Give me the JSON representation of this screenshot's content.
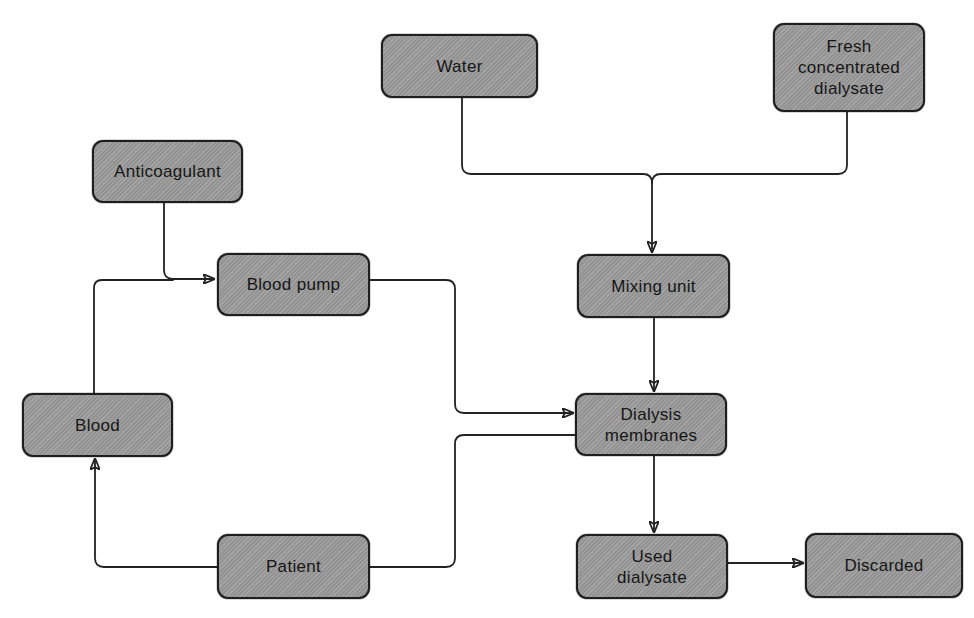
{
  "diagram": {
    "title": "",
    "type": "flowchart",
    "colors": {
      "node_fill": "#9c9c9c",
      "node_border": "#1e1e1e",
      "text": "#161616",
      "connector": "#222222",
      "background": "#ffffff"
    },
    "nodes": {
      "water": {
        "label": "Water"
      },
      "fresh_dialysate": {
        "label": "Fresh\nconcentrated\ndialysate"
      },
      "anticoagulant": {
        "label": "Anticoagulant"
      },
      "blood_pump": {
        "label": "Blood pump"
      },
      "mixing_unit": {
        "label": "Mixing unit"
      },
      "blood": {
        "label": "Blood"
      },
      "dialysis_membranes": {
        "label": "Dialysis\nmembranes"
      },
      "patient": {
        "label": "Patient"
      },
      "used_dialysate": {
        "label": "Used\ndialysate"
      },
      "discarded": {
        "label": "Discarded"
      }
    },
    "edges": [
      {
        "from": "Water",
        "to": "Mixing unit"
      },
      {
        "from": "Fresh concentrated dialysate",
        "to": "Mixing unit"
      },
      {
        "from": "Anticoagulant",
        "to": "Blood pump"
      },
      {
        "from": "Blood",
        "to": "Blood pump"
      },
      {
        "from": "Blood pump",
        "to": "Dialysis membranes"
      },
      {
        "from": "Mixing unit",
        "to": "Dialysis membranes"
      },
      {
        "from": "Dialysis membranes",
        "to": "Patient"
      },
      {
        "from": "Patient",
        "to": "Blood"
      },
      {
        "from": "Dialysis membranes",
        "to": "Used dialysate"
      },
      {
        "from": "Used dialysate",
        "to": "Discarded"
      }
    ]
  }
}
